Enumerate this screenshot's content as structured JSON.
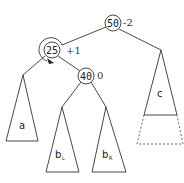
{
  "diagram": {
    "type": "avl-tree-rotation",
    "nodes": [
      {
        "id": "n50",
        "key": "50",
        "balance": "-2"
      },
      {
        "id": "n25",
        "key": "25",
        "balance": "+1"
      },
      {
        "id": "n40",
        "key": "40",
        "balance": "0"
      }
    ],
    "subtrees": [
      {
        "id": "a",
        "label": "a",
        "sub": ""
      },
      {
        "id": "bL",
        "label": "b",
        "sub": "L"
      },
      {
        "id": "bR",
        "label": "b",
        "sub": "R"
      },
      {
        "id": "c",
        "label": "c",
        "sub": ""
      }
    ],
    "edges": [
      [
        "50",
        "25"
      ],
      [
        "50",
        "c"
      ],
      [
        "25",
        "a"
      ],
      [
        "25",
        "40"
      ],
      [
        "40",
        "bL"
      ],
      [
        "40",
        "bR"
      ]
    ],
    "annotations": {
      "rotation_arrow_on": "25",
      "c_dashed_extension": true
    },
    "colors": {
      "stroke": "#333333",
      "background": "#ffffff"
    }
  }
}
